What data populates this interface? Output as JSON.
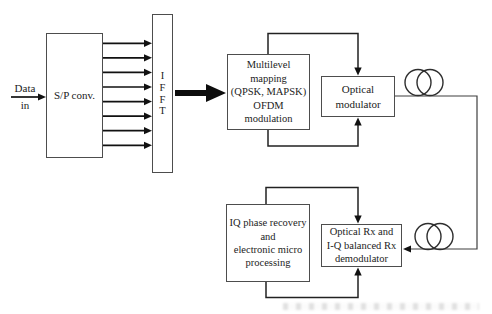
{
  "diagram": {
    "title_semantic": "Coherent optical OFDM system block diagram",
    "data_in": {
      "line1": "Data",
      "line2": "in"
    },
    "parallel_branches": 8,
    "blocks": {
      "sp": {
        "label": "S/P conv."
      },
      "ifft": {
        "label": "I\nF\nF\nT"
      },
      "multilevel": {
        "label": "Multilevel\nmapping\n(QPSK, MAPSK)\nOFDM\nmodulation"
      },
      "optical_modulator": {
        "label": "Optical\nmodulator"
      },
      "iq_recovery": {
        "label": "IQ phase recovery\nand\nelectronic micro\nprocessing"
      },
      "optical_rx": {
        "label": "Optical Rx and\nI-Q balanced Rx\ndemodulator"
      }
    },
    "icons": {
      "fiber_coil_top": "fiber-coil-icon",
      "fiber_coil_bottom": "fiber-coil-icon"
    },
    "colors": {
      "line": "#222222",
      "border": "#4d4d4d",
      "text": "#1c1c1c",
      "bg": "#ffffff"
    }
  }
}
